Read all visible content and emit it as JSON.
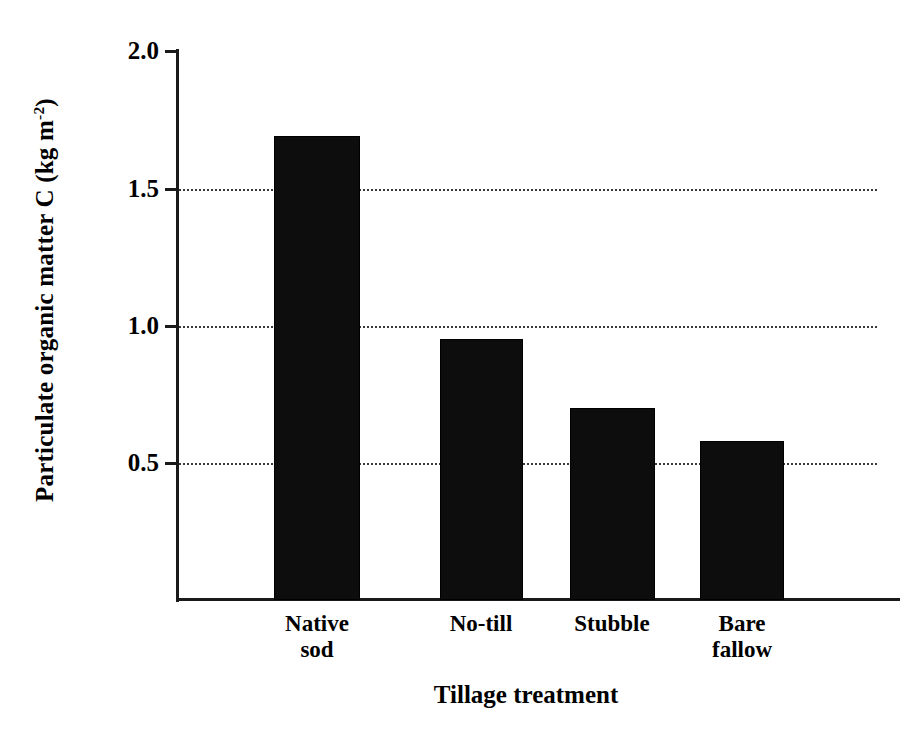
{
  "chart_data": {
    "type": "bar",
    "title": "",
    "subtitle": "",
    "categories": [
      "Native sod",
      "No-till",
      "Stubble",
      "Bare fallow"
    ],
    "category_lines": [
      [
        "Native",
        "sod"
      ],
      [
        "No-till"
      ],
      [
        "Stubble"
      ],
      [
        "Bare",
        "fallow"
      ]
    ],
    "values": [
      1.69,
      0.95,
      0.7,
      0.58
    ],
    "series": [
      {
        "name": "Particulate organic matter C",
        "values": [
          1.69,
          0.95,
          0.7,
          0.58
        ]
      }
    ],
    "xlabel": "Tillage treatment",
    "ylabel_text": "Particulate organic matter C (kg m",
    "ylabel_sup": "-2",
    "ylabel_tail": ")",
    "ylabel_full": "Particulate organic matter C (kg m-2)",
    "ylim": [
      0,
      2.0
    ],
    "yticks": [
      2.0,
      1.5,
      1.0,
      0.5
    ],
    "ytick_labels": [
      "2.0",
      "1.5",
      "1.0",
      "0.5"
    ],
    "gridlines_at": [
      1.5,
      1.0,
      0.5
    ],
    "grid": "horizontal-dotted",
    "legend": "none",
    "bar_color": "#0d0d0d",
    "axis_color": "#1a1a1a",
    "grid_color": "#3a3a3a",
    "background_color": "#ffffff"
  }
}
